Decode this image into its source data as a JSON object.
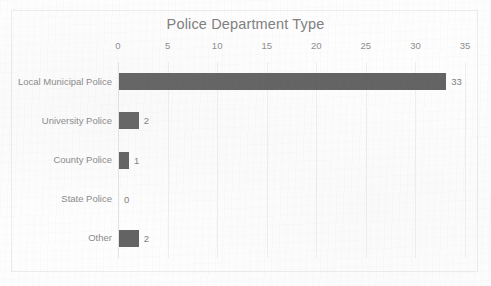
{
  "figure": {
    "title": "Police Department Type",
    "border_color": "#ececec",
    "background": "#fdfdfd"
  },
  "chart_data": {
    "type": "bar",
    "orientation": "horizontal",
    "title": "Police Department Type",
    "xlabel": "",
    "ylabel": "",
    "categories": [
      "Local Municipal Police",
      "University Police",
      "County Police",
      "State Police",
      "Other"
    ],
    "values": [
      33,
      2,
      1,
      0,
      2
    ],
    "data_labels": [
      "33",
      "2",
      "1",
      "0",
      "2"
    ],
    "xticks": [
      0,
      5,
      10,
      15,
      20,
      25,
      30,
      35
    ],
    "xtick_labels": [
      "0",
      "5",
      "10",
      "15",
      "20",
      "25",
      "30",
      "35"
    ],
    "xlim": [
      0,
      35
    ],
    "grid": "vertical",
    "legend": "none",
    "bar_color": "#636363",
    "text_color": "#8a8a8a",
    "title_color": "#808080",
    "gridline_color": "#efefef"
  }
}
